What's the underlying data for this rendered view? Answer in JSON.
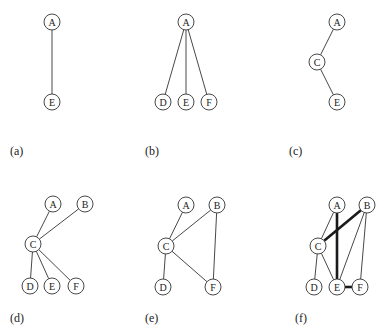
{
  "figure": {
    "panels": [
      {
        "id": "a",
        "label": "(a)",
        "label_pos": [
          10,
          155
        ],
        "nodes": [
          {
            "id": "A",
            "x": 52,
            "y": 22
          },
          {
            "id": "E",
            "x": 52,
            "y": 102
          }
        ],
        "edges": [
          {
            "from": "A",
            "to": "E",
            "thick": false
          }
        ]
      },
      {
        "id": "b",
        "label": "(b)",
        "label_pos": [
          145,
          155
        ],
        "nodes": [
          {
            "id": "A",
            "x": 186,
            "y": 22
          },
          {
            "id": "D",
            "x": 163,
            "y": 102
          },
          {
            "id": "E",
            "x": 186,
            "y": 102
          },
          {
            "id": "F",
            "x": 209,
            "y": 102
          }
        ],
        "edges": [
          {
            "from": "A",
            "to": "D",
            "thick": false
          },
          {
            "from": "A",
            "to": "E",
            "thick": false
          },
          {
            "from": "A",
            "to": "F",
            "thick": false
          }
        ]
      },
      {
        "id": "c",
        "label": "(c)",
        "label_pos": [
          289,
          155
        ],
        "nodes": [
          {
            "id": "A",
            "x": 337,
            "y": 22
          },
          {
            "id": "C",
            "x": 317,
            "y": 62
          },
          {
            "id": "E",
            "x": 337,
            "y": 102
          }
        ],
        "edges": [
          {
            "from": "A",
            "to": "C",
            "thick": false
          },
          {
            "from": "C",
            "to": "E",
            "thick": false
          }
        ]
      },
      {
        "id": "d",
        "label": "(d)",
        "label_pos": [
          10,
          322
        ],
        "nodes": [
          {
            "id": "A",
            "x": 53,
            "y": 204
          },
          {
            "id": "B",
            "x": 85,
            "y": 204
          },
          {
            "id": "C",
            "x": 33,
            "y": 244
          },
          {
            "id": "D",
            "x": 30,
            "y": 286
          },
          {
            "id": "E",
            "x": 52,
            "y": 286
          },
          {
            "id": "F",
            "x": 76,
            "y": 286
          }
        ],
        "edges": [
          {
            "from": "A",
            "to": "C",
            "thick": false
          },
          {
            "from": "B",
            "to": "C",
            "thick": false
          },
          {
            "from": "C",
            "to": "D",
            "thick": false
          },
          {
            "from": "C",
            "to": "E",
            "thick": false
          },
          {
            "from": "C",
            "to": "F",
            "thick": false
          }
        ]
      },
      {
        "id": "e",
        "label": "(e)",
        "label_pos": [
          145,
          322
        ],
        "nodes": [
          {
            "id": "A",
            "x": 186,
            "y": 205
          },
          {
            "id": "B",
            "x": 217,
            "y": 205
          },
          {
            "id": "C",
            "x": 166,
            "y": 246
          },
          {
            "id": "D",
            "x": 163,
            "y": 287
          },
          {
            "id": "F",
            "x": 213,
            "y": 287
          }
        ],
        "edges": [
          {
            "from": "A",
            "to": "C",
            "thick": false
          },
          {
            "from": "B",
            "to": "C",
            "thick": false
          },
          {
            "from": "B",
            "to": "F",
            "thick": false
          },
          {
            "from": "C",
            "to": "D",
            "thick": false
          },
          {
            "from": "C",
            "to": "F",
            "thick": false
          }
        ]
      },
      {
        "id": "f",
        "label": "(f)",
        "label_pos": [
          295,
          322
        ],
        "nodes": [
          {
            "id": "A",
            "x": 337,
            "y": 205
          },
          {
            "id": "B",
            "x": 367,
            "y": 205
          },
          {
            "id": "C",
            "x": 318,
            "y": 246
          },
          {
            "id": "D",
            "x": 314,
            "y": 287
          },
          {
            "id": "E",
            "x": 337,
            "y": 287
          },
          {
            "id": "F",
            "x": 360,
            "y": 287
          }
        ],
        "edges": [
          {
            "from": "A",
            "to": "C",
            "thick": false
          },
          {
            "from": "A",
            "to": "E",
            "thick": true
          },
          {
            "from": "B",
            "to": "C",
            "thick": true
          },
          {
            "from": "B",
            "to": "E",
            "thick": false
          },
          {
            "from": "B",
            "to": "F",
            "thick": false
          },
          {
            "from": "C",
            "to": "D",
            "thick": false
          },
          {
            "from": "C",
            "to": "E",
            "thick": false
          },
          {
            "from": "E",
            "to": "F",
            "thick": true
          }
        ]
      }
    ],
    "node_radius": 8,
    "colors": {
      "stroke": "#333333",
      "background": "#ffffff",
      "text": "#222222"
    }
  }
}
